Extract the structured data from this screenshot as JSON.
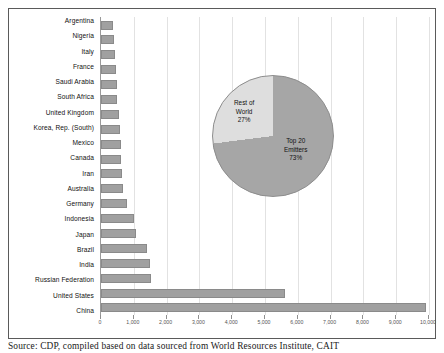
{
  "chart_data": {
    "type": "bar",
    "orientation": "horizontal",
    "title": "",
    "xlabel": "",
    "ylabel": "",
    "xlim": [
      0,
      10000
    ],
    "grid": true,
    "legend": "none",
    "tick_labels": [
      "0",
      "1,000",
      "2,000",
      "3,000",
      "4,000",
      "5,000",
      "6,000",
      "7,000",
      "8,000",
      "9,000",
      "10,000"
    ],
    "tick_values": [
      0,
      1000,
      2000,
      3000,
      4000,
      5000,
      6000,
      7000,
      8000,
      9000,
      10000
    ],
    "categories": [
      "Argentina",
      "Nigeria",
      "Italy",
      "France",
      "Saudi Arabia",
      "South Africa",
      "United Kingdom",
      "Korea, Rep. (South)",
      "Mexico",
      "Canada",
      "Iran",
      "Australia",
      "Germany",
      "Indonesia",
      "Japan",
      "Brazil",
      "India",
      "Russian Federation",
      "United States",
      "China"
    ],
    "values": [
      380,
      400,
      430,
      450,
      480,
      500,
      540,
      580,
      600,
      620,
      650,
      660,
      800,
      1000,
      1080,
      1400,
      1500,
      1520,
      5600,
      9900
    ],
    "series": [
      {
        "name": "Emissions",
        "values": [
          380,
          400,
          430,
          450,
          480,
          500,
          540,
          580,
          600,
          620,
          650,
          660,
          800,
          1000,
          1080,
          1400,
          1500,
          1520,
          5600,
          9900
        ]
      }
    ]
  },
  "pie_chart": {
    "type": "pie",
    "slices": [
      {
        "label_line1": "Top 20",
        "label_line2": "Emitters",
        "label_line3": "73%",
        "value": 73,
        "color": "#a6a6a6"
      },
      {
        "label_line1": "Rest of",
        "label_line2": "World",
        "label_line3": "27%",
        "value": 27,
        "color": "#dedede"
      }
    ]
  },
  "caption": {
    "text": "Source: CDP, compiled based on data sourced from World Resources Institute, CAIT"
  },
  "colors": {
    "bar_fill": "#a0a0a0",
    "bar_stroke": "#8a8a8a",
    "grid": "#e2e2e2",
    "frame": "#5a5a5a",
    "pie_major": "#a6a6a6",
    "pie_minor": "#dedede"
  }
}
